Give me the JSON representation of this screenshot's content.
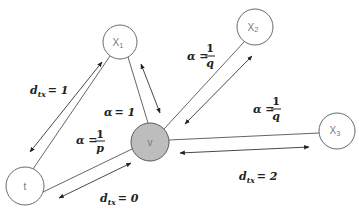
{
  "diagram": {
    "colors": {
      "current_node_fill": "#bdbdbd",
      "node_stroke": "#6a6a6a",
      "background": "#ffffff"
    },
    "nodes": [
      {
        "id": "t",
        "label": "t",
        "cx": 25,
        "cy": 186,
        "r": 19,
        "current": false
      },
      {
        "id": "v",
        "label": "v",
        "cx": 150,
        "cy": 142,
        "r": 19,
        "current": true
      },
      {
        "id": "x1",
        "label": "X",
        "sub": "1",
        "cx": 120,
        "cy": 42,
        "r": 17,
        "current": false
      },
      {
        "id": "x2",
        "label": "X",
        "sub": "2",
        "cx": 255,
        "cy": 27,
        "r": 18,
        "current": false
      },
      {
        "id": "x3",
        "label": "X",
        "sub": "3",
        "cx": 337,
        "cy": 131,
        "r": 18,
        "current": false
      }
    ],
    "edges": [
      {
        "from": "t",
        "to": "x1"
      },
      {
        "from": "x1",
        "to": "v"
      },
      {
        "from": "v",
        "to": "x2"
      },
      {
        "from": "v",
        "to": "x3"
      },
      {
        "from": "t",
        "to": "v"
      }
    ],
    "labels": {
      "d_tx_1": {
        "base": "d",
        "sub": "tx",
        "rhs": "= 1"
      },
      "alpha_1": {
        "lhs": "α",
        "rhs": "= 1"
      },
      "alpha_p": {
        "lhs": "α =",
        "num": "1",
        "den": "p"
      },
      "d_tx_0": {
        "base": "d",
        "sub": "tx",
        "rhs": "= 0"
      },
      "alpha_q_x2": {
        "lhs": "α =",
        "num": "1",
        "den": "q"
      },
      "alpha_q_x3": {
        "lhs": "α =",
        "num": "1",
        "den": "q"
      },
      "d_tx_2": {
        "base": "d",
        "sub": "tx",
        "rhs": "= 2"
      }
    }
  }
}
